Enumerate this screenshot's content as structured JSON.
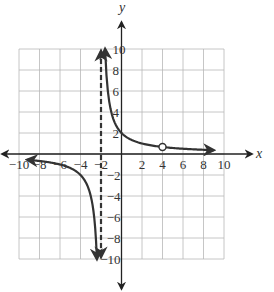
{
  "chart_data": {
    "type": "line",
    "title": "",
    "xlabel": "x",
    "ylabel": "y",
    "xlim": [
      -10,
      10
    ],
    "ylim": [
      -10,
      10
    ],
    "grid": true,
    "grid_step": 2,
    "x_ticks": [
      -10,
      -8,
      -6,
      -4,
      -2,
      2,
      4,
      6,
      8,
      10
    ],
    "y_ticks": [
      -10,
      -8,
      -6,
      -4,
      -2,
      2,
      4,
      6,
      8,
      10
    ],
    "x_tick_labels": [
      "−10",
      "−8",
      "−6",
      "−4",
      "−2",
      "2",
      "4",
      "6",
      "8",
      "10"
    ],
    "y_tick_labels": [
      "−10",
      "−8",
      "−6",
      "−4",
      "−2",
      "2",
      "4",
      "6",
      "8",
      "10"
    ],
    "function": "y = 4/(x+2), x ≠ 4",
    "vertical_asymptote": {
      "x": -2,
      "style": "dashed"
    },
    "horizontal_asymptote": {
      "y": 0
    },
    "hole": {
      "x": 4,
      "y": 0.667,
      "style": "open-circle"
    },
    "series": [
      {
        "name": "left-branch",
        "x": [
          -9.2,
          -8,
          -6,
          -4,
          -3,
          -2.5,
          -2.4
        ],
        "y": [
          -0.56,
          -0.67,
          -1,
          -2,
          -4,
          -8,
          -10
        ]
      },
      {
        "name": "right-branch",
        "x": [
          -1.6,
          -1.5,
          -1,
          0,
          1,
          2,
          4,
          6,
          9
        ],
        "y": [
          10,
          8,
          4,
          2,
          1.33,
          1,
          0.67,
          0.5,
          0.36
        ]
      }
    ]
  }
}
